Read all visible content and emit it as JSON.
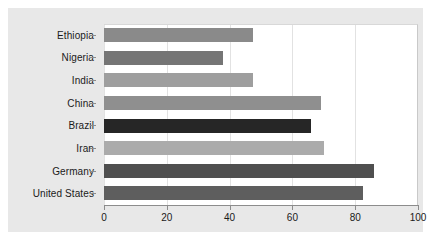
{
  "chart_data": {
    "type": "bar",
    "orientation": "horizontal",
    "title": "",
    "subtitle": "",
    "xlabel": "",
    "ylabel": "",
    "xlim": [
      0,
      100
    ],
    "xticks": [
      0,
      20,
      40,
      60,
      80,
      100
    ],
    "xticklabels": [
      "0",
      "20",
      "40",
      "60",
      "80",
      "100"
    ],
    "grid": true,
    "legend": false,
    "categories": [
      "Ethiopia",
      "Nigeria",
      "India",
      "China",
      "Brazil",
      "Iran",
      "Germany",
      "United States"
    ],
    "values": [
      47.5,
      38,
      47.5,
      69,
      66,
      70,
      86,
      82.5
    ],
    "bar_colors": [
      "#8a8a8a",
      "#757575",
      "#9e9e9e",
      "#8f8f8f",
      "#262626",
      "#ababab",
      "#4f4f4f",
      "#5e5e5e"
    ],
    "figure_background": "#e8e8e8",
    "plot_background": "#ffffff",
    "axis_color": "#8c8c8c",
    "gridline_color": "#e2e2e2",
    "text_color": "#1a1a1a"
  }
}
